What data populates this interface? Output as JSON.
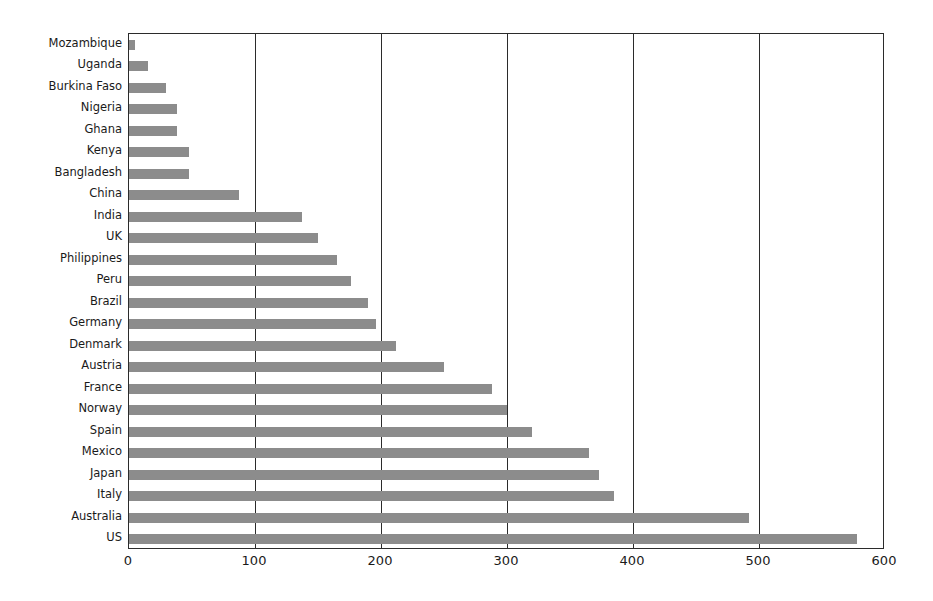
{
  "chart_data": {
    "type": "bar",
    "orientation": "horizontal",
    "title": "",
    "subtitle": "",
    "xlabel": "",
    "ylabel": "",
    "xlim": [
      0,
      600
    ],
    "ylim": null,
    "grid": "vertical-only",
    "legend": null,
    "legend_position": "none",
    "bar_color": "#8c8c8c",
    "axis_color": "#2b2b2b",
    "background_color": "#ffffff",
    "xticks": [
      0,
      100,
      200,
      300,
      400,
      500,
      600
    ],
    "xtick_labels": [
      "0",
      "100",
      "200",
      "300",
      "400",
      "500",
      "600"
    ],
    "categories": [
      "Mozambique",
      "Uganda",
      "Burkina Faso",
      "Nigeria",
      "Ghana",
      "Kenya",
      "Bangladesh",
      "China",
      "India",
      "UK",
      "Philippines",
      "Peru",
      "Brazil",
      "Germany",
      "Denmark",
      "Austria",
      "France",
      "Norway",
      "Spain",
      "Mexico",
      "Japan",
      "Italy",
      "Australia",
      "US"
    ],
    "values": [
      5,
      15,
      29,
      38,
      38,
      48,
      48,
      87,
      137,
      150,
      165,
      176,
      190,
      196,
      212,
      250,
      288,
      300,
      320,
      365,
      373,
      385,
      492,
      578
    ]
  }
}
